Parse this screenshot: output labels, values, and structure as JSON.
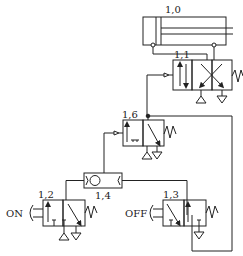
{
  "diagram": {
    "type": "pneumatic-circuit",
    "components": {
      "cylinder": {
        "id": "1,0",
        "label": "1,0"
      },
      "main_valve": {
        "id": "1,1",
        "label": "1,1"
      },
      "memory_valve": {
        "id": "1,6",
        "label": "1,6"
      },
      "shuttle_valve": {
        "id": "1,4",
        "label": "1,4"
      },
      "on_valve": {
        "id": "1,2",
        "label": "1,2",
        "button_label": "ON"
      },
      "off_valve": {
        "id": "1,3",
        "label": "1,3",
        "button_label": "OFF"
      }
    },
    "colors": {
      "line": "#222222",
      "background": "#ffffff"
    }
  }
}
